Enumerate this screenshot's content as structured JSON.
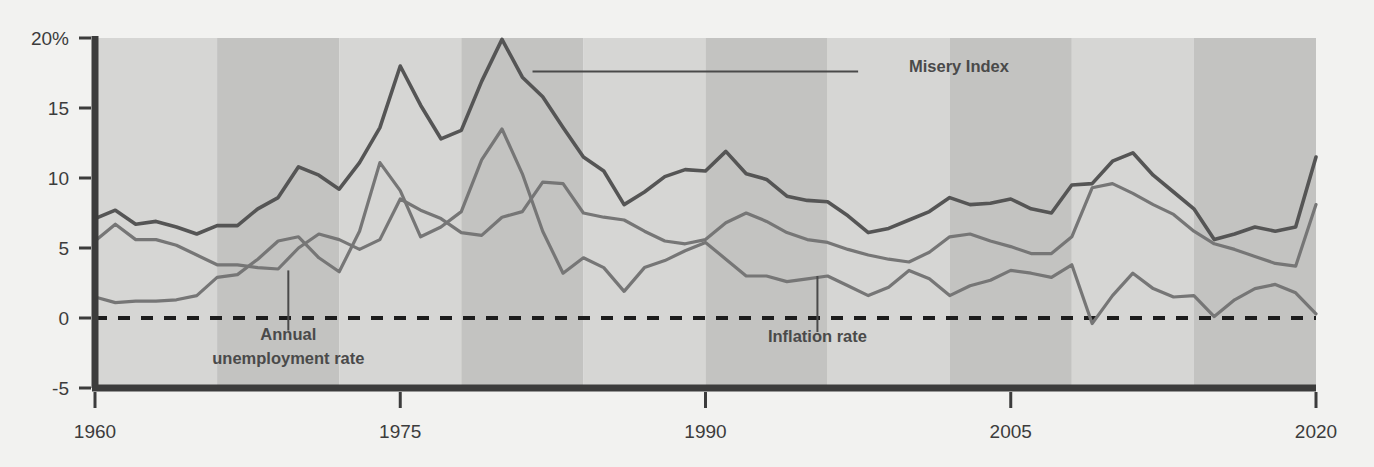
{
  "chart_data": {
    "type": "line",
    "title": "",
    "subtitle": "",
    "xlabel": "",
    "ylabel": "",
    "xlim": [
      1960,
      2020
    ],
    "ylim": [
      -5,
      20
    ],
    "grid": false,
    "legend_position": "inline-annotations",
    "y_ticks": [
      "20%",
      "15",
      "10",
      "5",
      "0",
      "-5"
    ],
    "y_tick_values": [
      20,
      15,
      10,
      5,
      0,
      -5
    ],
    "x_ticks": [
      "1960",
      "1975",
      "1990",
      "2005",
      "2020"
    ],
    "x_tick_values": [
      1960,
      1975,
      1990,
      2005,
      2020
    ],
    "zero_line": 0,
    "colors": {
      "misery_index": "#555555",
      "unemployment": "#767676",
      "inflation": "#767676",
      "axis": "#3c3c3c",
      "band_light": "#d6d6d4",
      "band_dark": "#c3c3c1",
      "background": "#f2f2f0",
      "label_text": "#4a4a4a"
    },
    "shaded_bands": [
      {
        "start": 1960,
        "end": 1966,
        "tone": "light"
      },
      {
        "start": 1966,
        "end": 1972,
        "tone": "dark"
      },
      {
        "start": 1972,
        "end": 1978,
        "tone": "light"
      },
      {
        "start": 1978,
        "end": 1984,
        "tone": "dark"
      },
      {
        "start": 1984,
        "end": 1990,
        "tone": "light"
      },
      {
        "start": 1990,
        "end": 1996,
        "tone": "dark"
      },
      {
        "start": 1996,
        "end": 2002,
        "tone": "light"
      },
      {
        "start": 2002,
        "end": 2008,
        "tone": "dark"
      },
      {
        "start": 2008,
        "end": 2014,
        "tone": "light"
      },
      {
        "start": 2014,
        "end": 2020,
        "tone": "dark"
      }
    ],
    "x": [
      1960,
      1961,
      1962,
      1963,
      1964,
      1965,
      1966,
      1967,
      1968,
      1969,
      1970,
      1971,
      1972,
      1973,
      1974,
      1975,
      1976,
      1977,
      1978,
      1979,
      1980,
      1981,
      1982,
      1983,
      1984,
      1985,
      1986,
      1987,
      1988,
      1989,
      1990,
      1991,
      1992,
      1993,
      1994,
      1995,
      1996,
      1997,
      1998,
      1999,
      2000,
      2001,
      2002,
      2003,
      2004,
      2005,
      2006,
      2007,
      2008,
      2009,
      2010,
      2011,
      2012,
      2013,
      2014,
      2015,
      2016,
      2017,
      2018,
      2019,
      2020
    ],
    "series": [
      {
        "name": "Misery Index",
        "color": "#555555",
        "width": 3.6,
        "values": [
          7.1,
          7.7,
          6.7,
          6.9,
          6.5,
          6.0,
          6.6,
          6.6,
          7.8,
          8.6,
          10.8,
          10.2,
          9.2,
          11.1,
          13.6,
          18.0,
          15.2,
          12.8,
          13.4,
          16.9,
          19.9,
          17.2,
          15.8,
          13.6,
          11.5,
          10.5,
          8.1,
          9.0,
          10.1,
          10.6,
          10.5,
          11.9,
          10.3,
          9.9,
          8.7,
          8.4,
          8.3,
          7.3,
          6.1,
          6.4,
          7.0,
          7.6,
          8.6,
          8.1,
          8.2,
          8.5,
          7.8,
          7.5,
          9.5,
          9.6,
          11.2,
          11.8,
          10.2,
          9.0,
          7.8,
          5.6,
          6.0,
          6.5,
          6.2,
          6.5,
          11.5
        ]
      },
      {
        "name": "Annual unemployment rate",
        "color": "#767676",
        "width": 3.2,
        "values": [
          5.5,
          6.7,
          5.6,
          5.6,
          5.2,
          4.5,
          3.8,
          3.8,
          3.6,
          3.5,
          5.0,
          6.0,
          5.6,
          4.9,
          5.6,
          8.5,
          7.7,
          7.1,
          6.1,
          5.9,
          7.2,
          7.6,
          9.7,
          9.6,
          7.5,
          7.2,
          7.0,
          6.2,
          5.5,
          5.3,
          5.6,
          6.8,
          7.5,
          6.9,
          6.1,
          5.6,
          5.4,
          4.9,
          4.5,
          4.2,
          4.0,
          4.7,
          5.8,
          6.0,
          5.5,
          5.1,
          4.6,
          4.6,
          5.8,
          9.3,
          9.6,
          8.9,
          8.1,
          7.4,
          6.2,
          5.3,
          4.9,
          4.4,
          3.9,
          3.7,
          8.1
        ]
      },
      {
        "name": "Inflation rate",
        "color": "#767676",
        "width": 3.2,
        "values": [
          1.5,
          1.1,
          1.2,
          1.2,
          1.3,
          1.6,
          2.9,
          3.1,
          4.2,
          5.5,
          5.8,
          4.3,
          3.3,
          6.2,
          11.1,
          9.1,
          5.8,
          6.5,
          7.6,
          11.3,
          13.5,
          10.3,
          6.2,
          3.2,
          4.3,
          3.6,
          1.9,
          3.6,
          4.1,
          4.8,
          5.4,
          4.2,
          3.0,
          3.0,
          2.6,
          2.8,
          3.0,
          2.3,
          1.6,
          2.2,
          3.4,
          2.8,
          1.6,
          2.3,
          2.7,
          3.4,
          3.2,
          2.9,
          3.8,
          -0.4,
          1.6,
          3.2,
          2.1,
          1.5,
          1.6,
          0.1,
          1.3,
          2.1,
          2.4,
          1.8,
          0.3
        ]
      }
    ],
    "annotations": [
      {
        "text": "Misery Index",
        "anchor_x": 2000,
        "anchor_y": 17.6,
        "leader_from_x": 1981.5,
        "leader_from_y": 17.6,
        "leader_to_x": 1997.5,
        "leader_to_y": 17.6,
        "align": "start"
      },
      {
        "text_line_1": "Annual",
        "text_line_2": "unemployment rate",
        "anchor_x": 1969.5,
        "anchor_y": -1.6,
        "leader_from_x": 1969.5,
        "leader_from_y": 3.4,
        "leader_to_x": 1969.5,
        "leader_to_y": -0.9,
        "align": "middle"
      },
      {
        "text": "Inflation rate",
        "anchor_x": 1995.5,
        "anchor_y": -1.7,
        "leader_from_x": 1995.5,
        "leader_from_y": 3.0,
        "leader_to_x": 1995.5,
        "leader_to_y": -1.0,
        "align": "middle"
      }
    ]
  }
}
